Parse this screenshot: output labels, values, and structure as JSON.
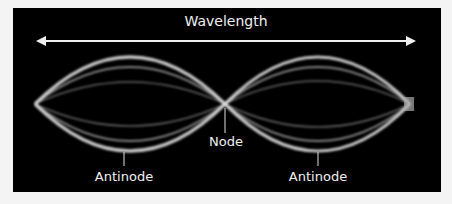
{
  "diagram": {
    "title_label": "Wavelength",
    "node_label": "Node",
    "antinode_left_label": "Antinode",
    "antinode_right_label": "Antinode",
    "colors": {
      "background": "#000000",
      "wave": "#e8e8e8",
      "frame": "#f4f4f4"
    }
  }
}
